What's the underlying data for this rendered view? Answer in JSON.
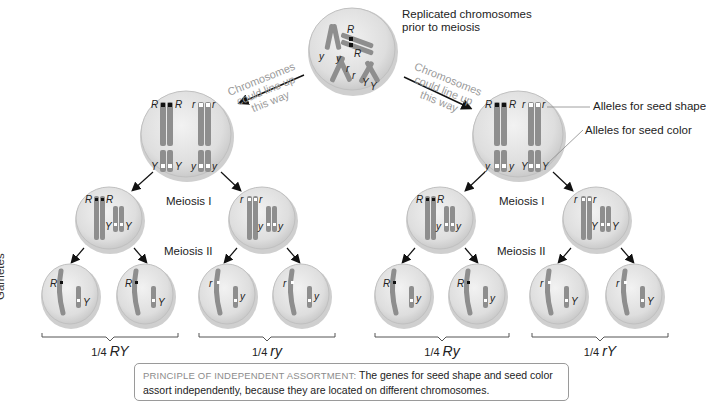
{
  "labels": {
    "replicated": [
      "Replicated chromosomes",
      "prior to meiosis"
    ],
    "lineup_left": [
      "Chromosomes",
      "could line up",
      "this way"
    ],
    "lineup_right": [
      "Chromosomes",
      "could line up",
      "this way"
    ],
    "seed_shape": "Alleles for seed shape",
    "seed_color": "Alleles for seed color",
    "meiosis1_left": "Meiosis I",
    "meiosis2_left": "Meiosis II",
    "meiosis1_right": "Meiosis I",
    "meiosis2_right": "Meiosis II",
    "gametes": "Gametes"
  },
  "ratios": [
    {
      "frac": "1/4",
      "genotype": "RY"
    },
    {
      "frac": "1/4",
      "genotype": "ry"
    },
    {
      "frac": "1/4",
      "genotype": "Ry"
    },
    {
      "frac": "1/4",
      "genotype": "rY"
    }
  ],
  "principle": {
    "title": "PRINCIPLE OF INDEPENDENT ASSORTMENT:",
    "line1": " The genes for seed shape and seed color",
    "line2": "assort independently, because they are located on different chromosomes."
  },
  "alleles": {
    "top": [
      "R",
      "R",
      "y",
      "y",
      "r",
      "r",
      "Y",
      "Y"
    ],
    "left_arrangement": [
      "R",
      "R",
      "r",
      "r",
      "Y",
      "Y",
      "y",
      "y"
    ],
    "right_arrangement": [
      "R",
      "R",
      "r",
      "r",
      "y",
      "y",
      "Y",
      "Y"
    ],
    "meiosis1_cells": [
      [
        "R",
        "R",
        "Y",
        "Y"
      ],
      [
        "r",
        "r",
        "y",
        "y"
      ],
      [
        "R",
        "R",
        "y",
        "y"
      ],
      [
        "r",
        "r",
        "Y",
        "Y"
      ]
    ],
    "gamete_cells": [
      [
        "R",
        "Y"
      ],
      [
        "R",
        "Y"
      ],
      [
        "r",
        "y"
      ],
      [
        "r",
        "y"
      ],
      [
        "R",
        "y"
      ],
      [
        "R",
        "y"
      ],
      [
        "r",
        "Y"
      ],
      [
        "r",
        "Y"
      ]
    ]
  },
  "colors": {
    "cell_fill": "#dcdcdc",
    "cell_edge": "#b8b8b8",
    "chromosome": "#8c8c8c",
    "dominant_marker": "#111111",
    "recessive_marker": "#ffffff",
    "arrow": "#111111",
    "gray_text": "#8a8a8a"
  }
}
